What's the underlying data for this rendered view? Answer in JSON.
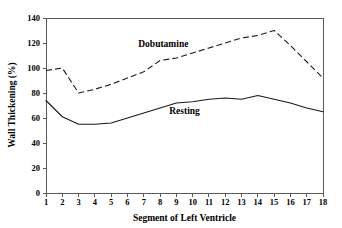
{
  "chart_data": {
    "type": "line",
    "title": "",
    "xlabel": "Segment of Left Ventricle",
    "ylabel": "Wall Thickening (%)",
    "x": [
      1,
      2,
      3,
      4,
      5,
      6,
      7,
      8,
      9,
      10,
      11,
      12,
      13,
      14,
      15,
      16,
      17,
      18
    ],
    "xtick_labels": [
      "1",
      "2",
      "3",
      "4",
      "5",
      "6",
      "7",
      "8",
      "9",
      "10",
      "11",
      "12",
      "13",
      "14",
      "15",
      "16",
      "17",
      "18"
    ],
    "ytick_labels": [
      "0",
      "20",
      "40",
      "60",
      "80",
      "100",
      "120",
      "140"
    ],
    "yticks": [
      0,
      20,
      40,
      60,
      80,
      100,
      120,
      140
    ],
    "xlim": [
      1,
      18
    ],
    "ylim": [
      0,
      140
    ],
    "grid": false,
    "legend_position": "inline-annotation",
    "series": [
      {
        "name": "Dobutamine",
        "style": "dashed",
        "color": "#1a1a1a",
        "label_x": 8.2,
        "label_y": 117,
        "values": [
          98,
          100,
          80,
          83,
          87,
          92,
          97,
          106,
          108,
          112,
          116,
          120,
          124,
          126,
          130,
          118,
          105,
          92
        ]
      },
      {
        "name": "Resting",
        "style": "solid",
        "color": "#1a1a1a",
        "label_x": 9.5,
        "label_y": 63,
        "values": [
          74,
          61,
          55,
          55,
          56,
          60,
          64,
          68,
          72,
          73,
          75,
          76,
          75,
          78,
          75,
          72,
          68,
          65
        ]
      }
    ]
  }
}
